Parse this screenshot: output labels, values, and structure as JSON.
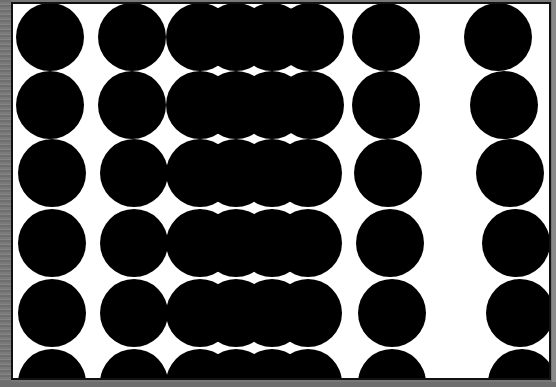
{
  "image": {
    "description": "Optical pattern of black circles arranged in columns on a white card with gray surround",
    "colors": {
      "background": "#ffffff",
      "circle": "#000000",
      "frame": "#111111",
      "surround": "#777777"
    },
    "circle_radius": 34,
    "rows_y": [
      37,
      105,
      173,
      243,
      313,
      383
    ],
    "columns": [
      {
        "name": "col-1",
        "x": [
          50,
          50,
          52,
          52,
          52,
          52
        ]
      },
      {
        "name": "col-2",
        "x": [
          132,
          132,
          134,
          134,
          134,
          134
        ]
      },
      {
        "name": "col-3",
        "x": [
          200,
          200,
          200,
          200,
          200,
          200
        ]
      },
      {
        "name": "col-4",
        "x": [
          236,
          236,
          236,
          236,
          236,
          236
        ]
      },
      {
        "name": "col-5",
        "x": [
          272,
          272,
          272,
          272,
          272,
          272
        ]
      },
      {
        "name": "col-6",
        "x": [
          310,
          310,
          308,
          308,
          308,
          308
        ]
      },
      {
        "name": "col-7",
        "x": [
          386,
          386,
          388,
          390,
          392,
          392
        ]
      },
      {
        "name": "col-8",
        "x": [
          498,
          504,
          510,
          516,
          520,
          522
        ]
      }
    ]
  }
}
